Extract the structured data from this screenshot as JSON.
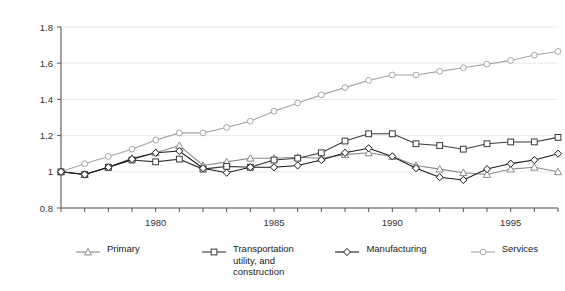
{
  "chart_data": {
    "type": "line",
    "title": "",
    "xlabel": "",
    "ylabel": "",
    "xlim": [
      1976,
      1997
    ],
    "ylim": [
      0.8,
      1.8
    ],
    "ytick_labels": [
      "0.8",
      "1",
      "1.2",
      "1.4",
      "1.6",
      "1.8"
    ],
    "yticks": [
      0.8,
      1.0,
      1.2,
      1.4,
      1.6,
      1.8
    ],
    "xtick_labels": [
      "1980",
      "1985",
      "1990",
      "1995"
    ],
    "xticks": [
      1980,
      1985,
      1990,
      1995
    ],
    "x": [
      1976,
      1977,
      1978,
      1979,
      1980,
      1981,
      1982,
      1983,
      1984,
      1985,
      1986,
      1987,
      1988,
      1989,
      1990,
      1991,
      1992,
      1993,
      1994,
      1995,
      1996,
      1997
    ],
    "grid": true,
    "grid_axis": "y",
    "legend_position": "bottom",
    "series": [
      {
        "name": "Primary",
        "marker": "triangle",
        "color": "#8a8a8a",
        "values": [
          1.0,
          0.985,
          1.025,
          1.075,
          1.105,
          1.145,
          1.035,
          1.055,
          1.075,
          1.075,
          1.08,
          1.075,
          1.095,
          1.105,
          1.085,
          1.035,
          1.015,
          0.995,
          0.985,
          1.015,
          1.025,
          1.0
        ]
      },
      {
        "name": "Transportation\nutility, and\nconstruction",
        "marker": "square",
        "color": "#3a3a3a",
        "values": [
          1.0,
          0.985,
          1.025,
          1.065,
          1.055,
          1.07,
          1.015,
          1.03,
          1.025,
          1.065,
          1.075,
          1.105,
          1.17,
          1.21,
          1.21,
          1.155,
          1.145,
          1.125,
          1.155,
          1.165,
          1.165,
          1.19
        ]
      },
      {
        "name": "Manufacturing",
        "marker": "diamond",
        "color": "#1a1a1a",
        "values": [
          1.0,
          0.985,
          1.025,
          1.07,
          1.105,
          1.115,
          1.02,
          0.995,
          1.025,
          1.025,
          1.035,
          1.065,
          1.105,
          1.13,
          1.085,
          1.02,
          0.97,
          0.955,
          1.015,
          1.045,
          1.065,
          1.1
        ]
      },
      {
        "name": "Services",
        "marker": "circle",
        "color": "#a6a6a6",
        "values": [
          1.0,
          1.045,
          1.085,
          1.125,
          1.175,
          1.215,
          1.215,
          1.245,
          1.28,
          1.335,
          1.38,
          1.425,
          1.465,
          1.505,
          1.535,
          1.535,
          1.555,
          1.575,
          1.595,
          1.615,
          1.645,
          1.665
        ]
      }
    ]
  },
  "legend": {
    "items": [
      {
        "label": "Primary",
        "marker": "triangle-marker",
        "color": "#8a8a8a"
      },
      {
        "label": "Transportation\nutility, and\nconstruction",
        "marker": "square-marker",
        "color": "#3a3a3a"
      },
      {
        "label": "Manufacturing",
        "marker": "diamond-marker",
        "color": "#1a1a1a"
      },
      {
        "label": "Services",
        "marker": "circle-marker",
        "color": "#a6a6a6"
      }
    ]
  }
}
